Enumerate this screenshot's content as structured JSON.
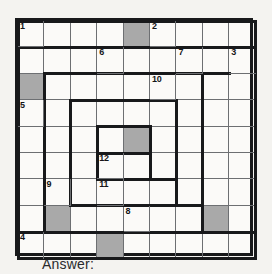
{
  "puzzle": {
    "type": "crossword-style numbered grid puzzle",
    "rows": 9,
    "cols": 9,
    "cell_size_px": 26.4,
    "colors": {
      "grid_line": "#6d6f72",
      "cage_line": "#18191b",
      "shaded_cell": "#a9a9a9",
      "cell_background": "#fbfaf8",
      "page_background": "#f2f1ee"
    },
    "clue_numbers": [
      {
        "label": "1",
        "row": 1,
        "col": 1
      },
      {
        "label": "2",
        "row": 1,
        "col": 6
      },
      {
        "label": "6",
        "row": 2,
        "col": 4
      },
      {
        "label": "7",
        "row": 2,
        "col": 7
      },
      {
        "label": "3",
        "row": 2,
        "col": 9
      },
      {
        "label": "10",
        "row": 3,
        "col": 6
      },
      {
        "label": "5",
        "row": 4,
        "col": 1
      },
      {
        "label": "12",
        "row": 6,
        "col": 4
      },
      {
        "label": "9",
        "row": 7,
        "col": 2
      },
      {
        "label": "11",
        "row": 7,
        "col": 4
      },
      {
        "label": "8",
        "row": 8,
        "col": 5
      },
      {
        "label": "4",
        "row": 9,
        "col": 1
      }
    ],
    "shaded_cells": [
      {
        "row": 1,
        "col": 5
      },
      {
        "row": 3,
        "col": 1
      },
      {
        "row": 5,
        "col": 5
      },
      {
        "row": 8,
        "col": 2
      },
      {
        "row": 8,
        "col": 8
      },
      {
        "row": 9,
        "col": 4
      }
    ],
    "cage_borders": {
      "note": "thick black rectangular spiral boundaries, coordinates in grid cell units (0..9) from top-left of grid",
      "horizontal": [
        {
          "x1": 0,
          "x2": 9,
          "y": 0
        },
        {
          "x1": 0,
          "x2": 9,
          "y": 1
        },
        {
          "x1": 1,
          "x2": 8,
          "y": 2
        },
        {
          "x1": 2,
          "x2": 6,
          "y": 3
        },
        {
          "x1": 3,
          "x2": 5,
          "y": 4
        },
        {
          "x1": 3,
          "x2": 5,
          "y": 5
        },
        {
          "x1": 3,
          "x2": 6,
          "y": 6
        },
        {
          "x1": 2,
          "x2": 7,
          "y": 7
        },
        {
          "x1": 0,
          "x2": 9,
          "y": 8
        },
        {
          "x1": 0,
          "x2": 9,
          "y": 9
        }
      ],
      "vertical": [
        {
          "y1": 0,
          "y2": 9,
          "x": 0
        },
        {
          "y1": 2,
          "y2": 8,
          "x": 1
        },
        {
          "y1": 3,
          "y2": 7,
          "x": 2
        },
        {
          "y1": 4,
          "y2": 6,
          "x": 3
        },
        {
          "y1": 4,
          "y2": 6,
          "x": 5
        },
        {
          "y1": 3,
          "y2": 7,
          "x": 6
        },
        {
          "y1": 2,
          "y2": 8,
          "x": 7
        },
        {
          "y1": 0,
          "y2": 9,
          "x": 9
        }
      ]
    }
  },
  "answer": {
    "label": "Answer:",
    "value": ""
  }
}
